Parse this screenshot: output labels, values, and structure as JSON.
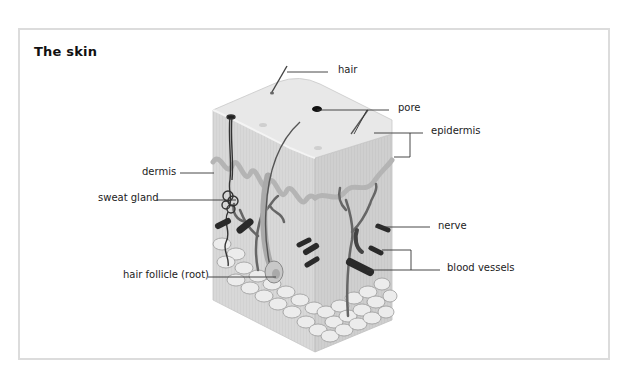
{
  "title": "The skin",
  "labels": {
    "hair": "hair",
    "pore": "pore",
    "epidermis": "epidermis",
    "dermis": "dermis",
    "sweat_gland": "sweat gland",
    "nerve": "nerve",
    "blood_vessels": "blood vessels",
    "hair_follicle": "hair follicle (root)"
  },
  "colors": {
    "frame_border": "#dcdcdc",
    "skin_top": "#e6e6e6",
    "skin_side": "#d6d6d6",
    "epidermis_band": "#a8a8a8",
    "vessel": "#555555",
    "vessel_dark": "#2a2a2a",
    "fat_cell": "#ececec",
    "leader_line": "#333333"
  }
}
